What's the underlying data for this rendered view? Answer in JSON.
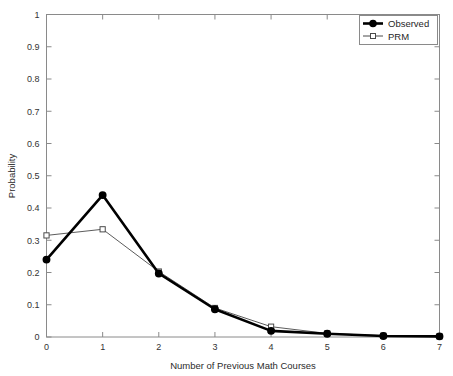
{
  "chart_data": {
    "type": "line",
    "title": "",
    "xlabel": "Number of Previous Math Courses",
    "ylabel": "Probability",
    "xlim": [
      0,
      7
    ],
    "ylim": [
      0,
      1
    ],
    "grid": false,
    "legend_position": "top-right",
    "x": [
      0,
      1,
      2,
      3,
      4,
      5,
      6,
      7
    ],
    "xticks": [
      "0",
      "1",
      "2",
      "3",
      "4",
      "5",
      "6",
      "7"
    ],
    "yticks": [
      "0",
      "0.1",
      "0.2",
      "0.3",
      "0.4",
      "0.5",
      "0.6",
      "0.7",
      "0.8",
      "0.9",
      "1"
    ],
    "ytick_values": [
      0,
      0.1,
      0.2,
      0.3,
      0.4,
      0.5,
      0.6,
      0.7,
      0.8,
      0.9,
      1
    ],
    "series": [
      {
        "name": "Observed",
        "marker": "filled-circle",
        "line_style": "solid",
        "line_width": 2.6,
        "color": "#000000",
        "values": [
          0.24,
          0.44,
          0.197,
          0.086,
          0.019,
          0.01,
          0.003,
          0.002
        ]
      },
      {
        "name": "PRM",
        "marker": "open-square",
        "line_style": "solid",
        "line_width": 0.9,
        "color": "#4a4a4a",
        "values": [
          0.315,
          0.334,
          0.203,
          0.09,
          0.032,
          0.011,
          0.004,
          0.002
        ]
      }
    ]
  },
  "legend": {
    "entries": [
      {
        "label": "Observed"
      },
      {
        "label": "PRM"
      }
    ]
  },
  "axes": {
    "x_title": "Number of Previous Math Courses",
    "y_title": "Probability",
    "x_tick_labels": [
      "0",
      "1",
      "2",
      "3",
      "4",
      "5",
      "6",
      "7"
    ],
    "y_tick_labels": [
      "0",
      "0.1",
      "0.2",
      "0.3",
      "0.4",
      "0.5",
      "0.6",
      "0.7",
      "0.8",
      "0.9",
      "1"
    ]
  },
  "colors": {
    "observed": "#000000",
    "prm": "#4a4a4a",
    "frame": "#8a8a8a",
    "background": "#ffffff",
    "text": "#2b2b2b"
  }
}
